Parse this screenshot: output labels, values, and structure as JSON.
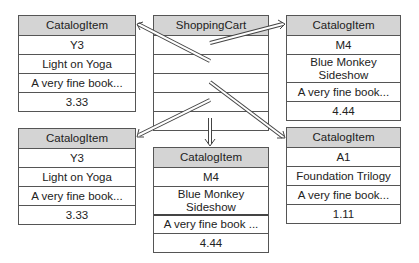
{
  "diagram": {
    "cart": {
      "title": "ShoppingCart",
      "slots": 5
    },
    "items": [
      {
        "id": "top-left",
        "header": "CatalogItem",
        "code": "Y3",
        "title": "Light on Yoga",
        "description": "A very fine book...",
        "price": "3.33"
      },
      {
        "id": "top-right",
        "header": "CatalogItem",
        "code": "M4",
        "title": "Blue Monkey Sideshow",
        "description": "A very fine book...",
        "price": "4.44"
      },
      {
        "id": "bottom-left",
        "header": "CatalogItem",
        "code": "Y3",
        "title": "Light on Yoga",
        "description": "A very fine book...",
        "price": "3.33"
      },
      {
        "id": "bottom-middle",
        "header": "CatalogItem",
        "code": "M4",
        "title": "Blue Monkey Sideshow",
        "description": "A very fine book ...",
        "price": "4.44"
      },
      {
        "id": "bottom-right",
        "header": "CatalogItem",
        "code": "A1",
        "title": "Foundation Trilogy",
        "description": "A very fine book...",
        "price": "1.11"
      }
    ],
    "references": [
      {
        "from": "cart-slot-1",
        "to": "top-left"
      },
      {
        "from": "cart-slot-1",
        "to": "top-right"
      },
      {
        "from": "cart-slot-3",
        "to": "bottom-right"
      },
      {
        "from": "cart-slot-4",
        "to": "bottom-left"
      },
      {
        "from": "cart-slot-5",
        "to": "bottom-middle"
      }
    ],
    "colors": {
      "header_fill": "#d4d4d4",
      "border": "#555555",
      "arrow": "#444444"
    }
  }
}
